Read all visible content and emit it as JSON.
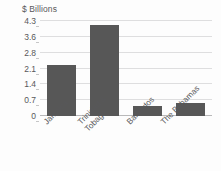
{
  "chart_data": {
    "type": "bar",
    "title": "",
    "subtitle": "",
    "xlabel": "",
    "ylabel": "$ Billions",
    "categories": [
      "Jamaica",
      "Trinidad & Tobago",
      "Barbados",
      "The Bahamas"
    ],
    "category_lines": [
      [
        "Jamaica"
      ],
      [
        "Trinidad &",
        "Tobago"
      ],
      [
        "Barbados"
      ],
      [
        "The Bahamas"
      ]
    ],
    "values": [
      2.3,
      4.1,
      0.45,
      0.6
    ],
    "ytick_labels": [
      "4.3",
      "3.6",
      "2.8",
      "2.1",
      "1.4",
      "0.7",
      "0"
    ],
    "ytick_values": [
      4.3,
      3.6,
      2.8,
      2.1,
      1.4,
      0.7,
      0
    ],
    "ylim": [
      0,
      4.3
    ],
    "grid": true,
    "legend": "none",
    "bar_color": "#575757",
    "gridline_color": "#dededf",
    "axis_color": "#b9b9ba",
    "text_color": "#58585a",
    "background_color": "#fdfdfd"
  }
}
